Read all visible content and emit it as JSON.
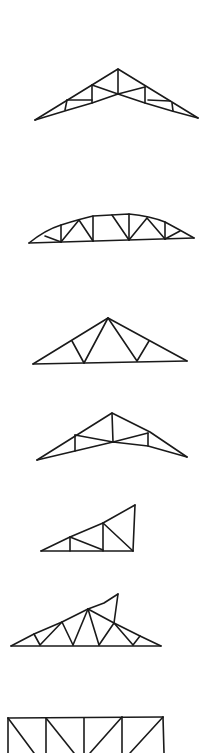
{
  "diagram": {
    "title": "",
    "stroke_color": "#1a1a1a",
    "background_color": "#ffffff",
    "trusses": [
      {
        "id": "scissor-truss",
        "label": "",
        "type": "scissor"
      },
      {
        "id": "bowstring-truss",
        "label": "",
        "type": "bowstring"
      },
      {
        "id": "fink-truss",
        "label": "",
        "type": "fink"
      },
      {
        "id": "scissor-truss-2",
        "label": "",
        "type": "scissor"
      },
      {
        "id": "mono-pitch-truss",
        "label": "",
        "type": "mono"
      },
      {
        "id": "dual-pitch-truss",
        "label": "",
        "type": "dual-pitch"
      },
      {
        "id": "flat-truss",
        "label": "",
        "type": "flat-pratt"
      }
    ]
  }
}
